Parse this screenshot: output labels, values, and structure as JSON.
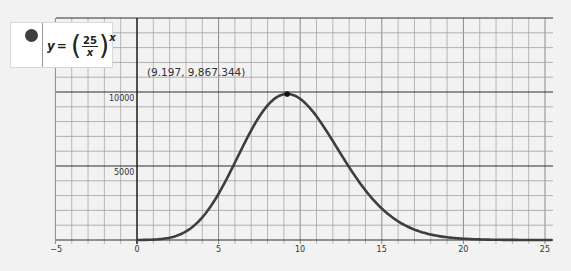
{
  "legend": {
    "series_color": "#3e3e3e",
    "lhs": "y",
    "eq": "=",
    "numerator": "25",
    "denominator": "x",
    "lparen": "(",
    "rparen": ")",
    "exponent": "x"
  },
  "annotation": {
    "label": "(9.197, 9,867.344)"
  },
  "axes": {
    "x_ticks": [
      "−5",
      "0",
      "5",
      "10",
      "15",
      "20",
      "25"
    ],
    "y_ticks": [
      "5000",
      "10000"
    ]
  },
  "chart_data": {
    "type": "line",
    "title": "",
    "xlabel": "",
    "ylabel": "",
    "function": "y = (25/x)^x",
    "xlim": [
      -5,
      25.5
    ],
    "ylim": [
      0,
      15000
    ],
    "grid": true,
    "x_major_step": 5,
    "x_minor_step": 1,
    "y_major_step": 5000,
    "y_minor_step": 1000,
    "legend_position": "top-left",
    "x_tick_labels": [
      -5,
      0,
      5,
      10,
      15,
      20,
      25
    ],
    "y_tick_labels": [
      5000,
      10000
    ],
    "series": [
      {
        "name": "y = (25/x)^x",
        "color": "#3e3e3e",
        "x": [
          0,
          1,
          2,
          3,
          4,
          5,
          6,
          7,
          8,
          9,
          9.197,
          10,
          11,
          12,
          13,
          14,
          15,
          16,
          17,
          18,
          19,
          20,
          21,
          22,
          23,
          24,
          25,
          25.5
        ],
        "y": [
          1,
          25,
          156.25,
          578.7,
          1525.9,
          3125,
          5277.8,
          7463.2,
          9094.9,
          9856.1,
          9867.344,
          9536.7,
          8460.4,
          6754.5,
          4960,
          3411.7,
          2118.5,
          1266,
          706.4,
          369.8,
          183.8,
          86.7,
          38.5,
          12.9,
          5.4,
          2.7,
          1,
          0.6
        ]
      }
    ],
    "annotations": [
      {
        "text": "(9.197, 9,867.344)",
        "x": 9.197,
        "y": 9867.344,
        "type": "maximum"
      }
    ]
  }
}
